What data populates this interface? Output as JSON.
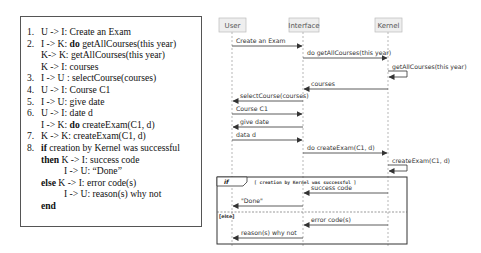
{
  "use_case_text": {
    "lines": [
      {
        "num": "1.",
        "text": "U -> I: Create an Exam"
      },
      {
        "num": "2.",
        "pre": "I -> K: ",
        "kw": "do",
        "post": " getAllCourses(this year)"
      },
      {
        "num": "",
        "text": "K-> K: getAllCourses(this year)"
      },
      {
        "num": "",
        "text": "K -> I: courses"
      },
      {
        "num": "3.",
        "text": "I -> U : selectCourse(courses)"
      },
      {
        "num": "4.",
        "text": "U -> I: Course C1"
      },
      {
        "num": "5.",
        "text": "I -> U: give date"
      },
      {
        "num": "6.",
        "text": "U -> I: date d"
      },
      {
        "num": "",
        "pre": "I -> K: ",
        "kw": "do",
        "post": " createExam(C1, d)"
      },
      {
        "num": "7.",
        "text": "K -> K: createExam(C1, d)"
      },
      {
        "num": "8.",
        "kw": "if",
        "post": "  creation by Kernel was successful"
      },
      {
        "num": "",
        "kw": "then",
        "post": " K -> I: success code"
      },
      {
        "num": "",
        "text": "I -> U: “Done”"
      },
      {
        "num": "",
        "kw": "else",
        "post": "  K -> I: error code(s)"
      },
      {
        "num": "",
        "text": "I -> U: reason(s) why not"
      },
      {
        "num": "",
        "kw": "end"
      }
    ]
  },
  "sequence_diagram": {
    "participants": [
      "User",
      "Interface",
      "Kernel"
    ],
    "messages": [
      {
        "from": "User",
        "to": "Interface",
        "label": "Create an Exam"
      },
      {
        "from": "Interface",
        "to": "Kernel",
        "label": "do getAllCourses(this year)"
      },
      {
        "from": "Kernel",
        "to": "Kernel",
        "label": "getAllCourses(this year)"
      },
      {
        "from": "Kernel",
        "to": "Interface",
        "label": "courses"
      },
      {
        "from": "Interface",
        "to": "User",
        "label": "selectCourse(courses)"
      },
      {
        "from": "User",
        "to": "Interface",
        "label": "Course C1"
      },
      {
        "from": "Interface",
        "to": "User",
        "label": "give date"
      },
      {
        "from": "User",
        "to": "Interface",
        "label": "data d"
      },
      {
        "from": "Interface",
        "to": "Kernel",
        "label": "do createExam(C1, d)"
      },
      {
        "from": "Kernel",
        "to": "Kernel",
        "label": "createExam(C1, d)"
      },
      {
        "from": "Kernel",
        "to": "Interface",
        "label": "success code"
      },
      {
        "from": "Interface",
        "to": "User",
        "label": "\"Done\""
      },
      {
        "from": "Kernel",
        "to": "Interface",
        "label": "error code(s)"
      },
      {
        "from": "Interface",
        "to": "User",
        "label": "reason(s) why not"
      }
    ],
    "fragment": {
      "operator": "if",
      "guard": "[ creation by Kernel was successful ]",
      "else_label": "[else]"
    }
  }
}
